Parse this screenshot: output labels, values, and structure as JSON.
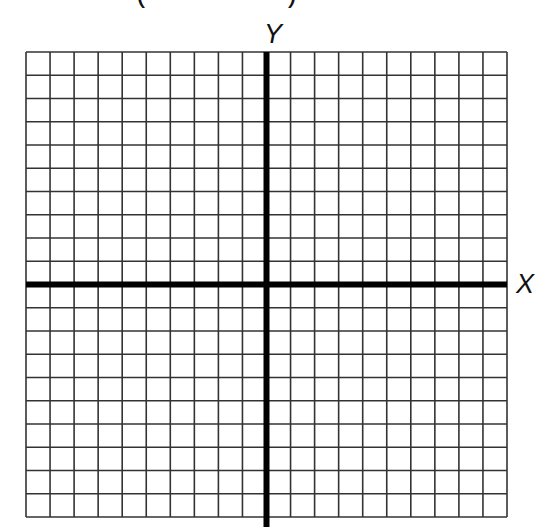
{
  "header": {
    "clipped_text_left": "(",
    "clipped_text_right": ")"
  },
  "grid": {
    "columns": 20,
    "rows": 20,
    "left": 26,
    "top": 52,
    "right": 507,
    "bottom": 517,
    "line_color": "#333333",
    "axis_color": "#000000"
  },
  "axes": {
    "x_label": "X",
    "y_label": "Y",
    "origin_column": 10,
    "origin_row": 10
  }
}
